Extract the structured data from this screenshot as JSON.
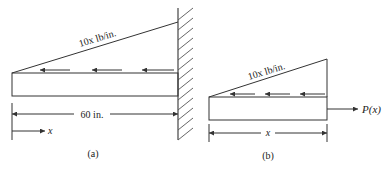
{
  "figure_a": {
    "caption": "(a)",
    "load_label": "10x lb/in.",
    "length_label": "60 in.",
    "axis_label": "x"
  },
  "figure_b": {
    "caption": "(b)",
    "load_label": "10x lb/in.",
    "length_label": "x",
    "force_label": "P(x)"
  },
  "colors": {
    "line": "#333333",
    "background": "#ffffff"
  }
}
